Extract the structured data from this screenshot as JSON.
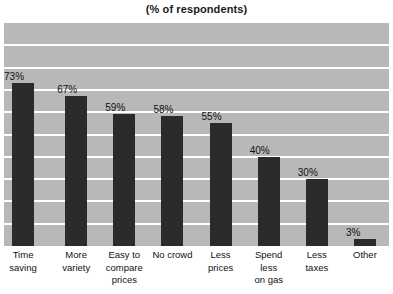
{
  "chart_data": {
    "type": "bar",
    "title": "(% of respondents)",
    "xlabel": "",
    "ylabel": "",
    "ylim": [
      0,
      100
    ],
    "grid": true,
    "gridlines_horizontal": 9,
    "legend": "none",
    "value_suffix": "%",
    "plot_background": "#b8b8b8",
    "bar_color": "#2b2b2b",
    "gridline_color": "#ffffff",
    "categories": [
      "Time\nsaving",
      "More\nvariety",
      "Easy to\ncompare\nprices",
      "No crowd",
      "Less\nprices",
      "Spend\nless\non gas",
      "Less\ntaxes",
      "Other"
    ],
    "values": [
      73,
      67,
      59,
      58,
      55,
      40,
      30,
      3
    ],
    "value_labels": [
      "73%",
      "67%",
      "59%",
      "58%",
      "55%",
      "40%",
      "30%",
      "3%"
    ]
  }
}
